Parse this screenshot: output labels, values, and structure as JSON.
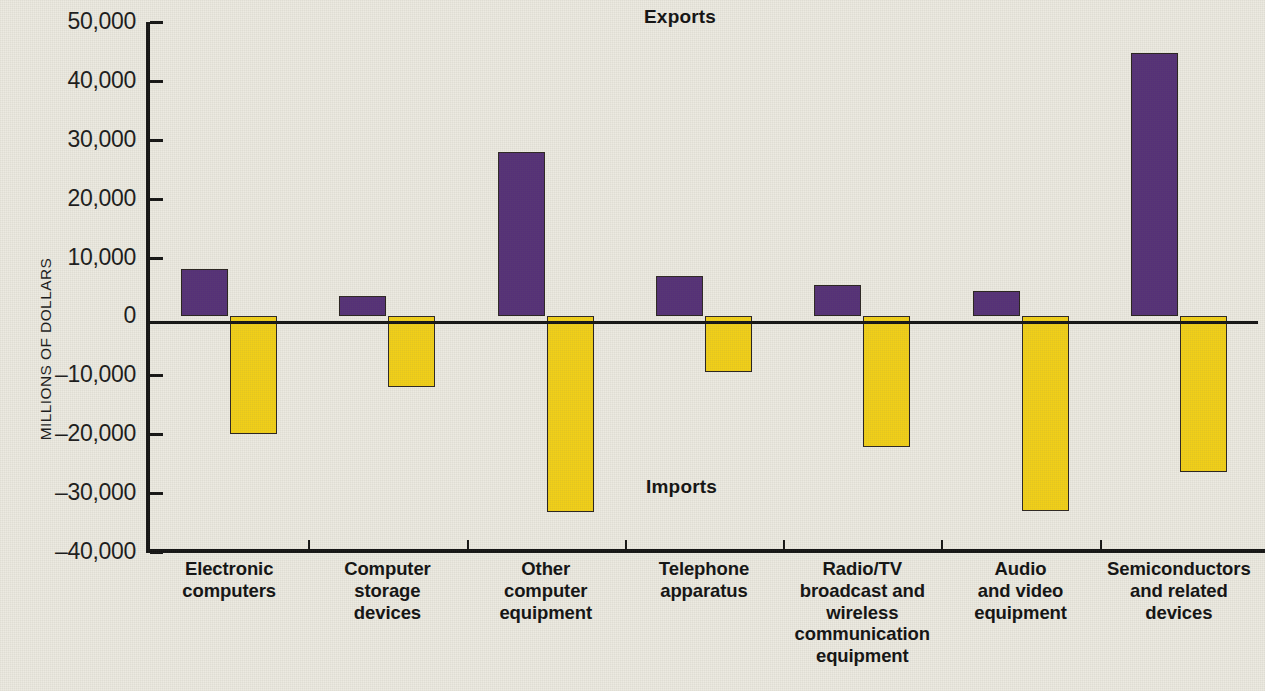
{
  "chart_data": {
    "type": "bar",
    "title": "",
    "xlabel": "",
    "ylabel": "MILLIONS OF DOLLARS",
    "ylim": [
      -40000,
      50000
    ],
    "ytick_values": [
      50000,
      40000,
      30000,
      20000,
      10000,
      0,
      -10000,
      -20000,
      -30000,
      -40000
    ],
    "ytick_labels": [
      "50,000",
      "40,000",
      "30,000",
      "20,000",
      "10,000",
      "0",
      "–10,000",
      "–20,000",
      "–30,000",
      "–40,000"
    ],
    "grid": false,
    "legend_position": "in-plot-annotations",
    "annotations": [
      {
        "text": "Exports",
        "series": "Exports"
      },
      {
        "text": "Imports",
        "series": "Imports"
      }
    ],
    "categories": [
      "Electronic\ncomputers",
      "Computer\nstorage\ndevices",
      "Other\ncomputer\nequipment",
      "Telephone\napparatus",
      "Radio/TV\nbroadcast and\nwireless\ncommunication\nequipment",
      "Audio\nand video\nequipment",
      "Semiconductors\nand related\ndevices"
    ],
    "category_lines": [
      [
        "Electronic",
        "computers"
      ],
      [
        "Computer",
        "storage",
        "devices"
      ],
      [
        "Other",
        "computer",
        "equipment"
      ],
      [
        "Telephone",
        "apparatus"
      ],
      [
        "Radio/TV",
        "broadcast and",
        "wireless",
        "communication",
        "equipment"
      ],
      [
        "Audio",
        "and video",
        "equipment"
      ],
      [
        "Semiconductors",
        "and related",
        "devices"
      ]
    ],
    "series": [
      {
        "name": "Exports",
        "color": "#553077",
        "values": [
          8100,
          3400,
          27900,
          6800,
          5300,
          4300,
          44700
        ]
      },
      {
        "name": "Imports",
        "color": "#f2d017",
        "values": [
          -19900,
          -11900,
          -33200,
          -9400,
          -22100,
          -33100,
          -26400
        ]
      }
    ]
  },
  "colors": {
    "exports": "#553077",
    "imports": "#f2d017",
    "axis": "#141414",
    "background": "#eceae1"
  }
}
